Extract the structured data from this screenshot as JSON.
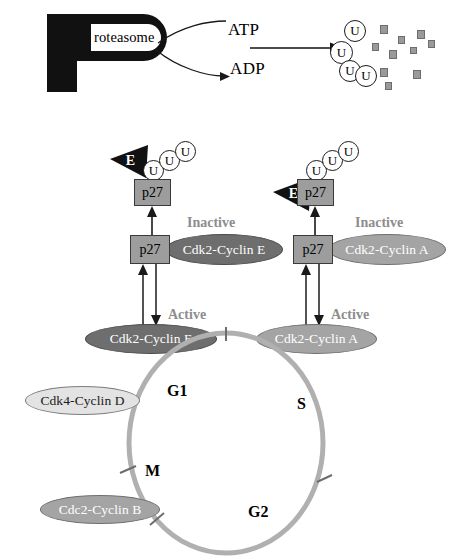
{
  "diagram": {
    "colors": {
      "complex_dark": "#6e6e6e",
      "complex_mid": "#a4a4a4",
      "complex_light": "#e3e3e3",
      "p27_box": "#9d9d9d",
      "ring": "#b0b0b0",
      "fragment": "#9a9a9a",
      "state_label": "#8d8d8d",
      "ink": "#111111"
    }
  },
  "proteasome": {
    "letter": "P",
    "word": "roteasome",
    "inputs": [
      {
        "id": "atp",
        "label": "ATP"
      },
      {
        "id": "adp",
        "label": "ADP"
      }
    ],
    "product": {
      "ubiquitins": [
        {
          "label": "U"
        },
        {
          "label": "U"
        },
        {
          "label": "U"
        },
        {
          "label": "U"
        }
      ],
      "fragment_count": 10
    }
  },
  "branches": [
    {
      "id": "cyclin-e",
      "enzyme_label": "E",
      "ubiquitin_chain": [
        "U",
        "U",
        "U"
      ],
      "substrate_top": "p27",
      "substrate_bottom": "p27",
      "inactive_state": "Inactive",
      "inactive_complex": "Cdk2-Cyclin E",
      "active_state": "Active",
      "active_complex": "Cdk2-Cyclin E"
    },
    {
      "id": "cyclin-a",
      "enzyme_label": "E",
      "ubiquitin_chain": [
        "U",
        "U",
        "U"
      ],
      "substrate_top": "p27",
      "substrate_bottom": "p27",
      "inactive_state": "Inactive",
      "inactive_complex": "Cdk2-Cyclin A",
      "active_state": "Active",
      "active_complex": "Cdk2-Cyclin A"
    }
  ],
  "cell_cycle": {
    "phases": [
      {
        "id": "g1",
        "label": "G1"
      },
      {
        "id": "s",
        "label": "S"
      },
      {
        "id": "g2",
        "label": "G2"
      },
      {
        "id": "m",
        "label": "M"
      }
    ],
    "peripheral_complexes": [
      {
        "id": "cdk4-cyclin-d",
        "label": "Cdk4-Cyclin D",
        "shade": "light"
      },
      {
        "id": "cdc2-cyclin-b",
        "label": "Cdc2-Cyclin B",
        "shade": "mid"
      }
    ]
  }
}
